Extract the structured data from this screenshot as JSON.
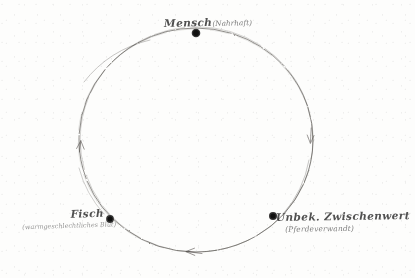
{
  "diagram": {
    "medium": "pencil sketch on aged paper",
    "stroke_color": "#4a4642",
    "node_color": "#20201e",
    "background_color": "#fdfdfc",
    "circle": {
      "center_x": 196,
      "center_y": 140,
      "radius_x": 117,
      "radius_y": 112,
      "direction": "counter-clockwise"
    },
    "nodes": [
      {
        "id": "mensch",
        "label": "Mensch",
        "paren": "(Nahrhaft)",
        "sub": "",
        "x": 196,
        "y": 33,
        "position": "top"
      },
      {
        "id": "fisch",
        "label": "Fisch",
        "paren": "",
        "sub": "(warmgeschlechtliches Blut)",
        "x": 110,
        "y": 219,
        "position": "bottom-left"
      },
      {
        "id": "unbek",
        "label": "Unbek. Zwischenwert",
        "paren": "",
        "sub": "(Pferdeverwandt)",
        "x": 273,
        "y": 216,
        "position": "bottom-right"
      }
    ],
    "arrows": [
      {
        "id": "arrow-left",
        "angle_deg": 196,
        "points": "up",
        "x": 80,
        "y": 147
      },
      {
        "id": "arrow-bottom",
        "angle_deg": 95,
        "points": "left",
        "x": 190,
        "y": 252
      },
      {
        "id": "arrow-right",
        "angle_deg": 347,
        "points": "down",
        "x": 311,
        "y": 140
      }
    ]
  }
}
